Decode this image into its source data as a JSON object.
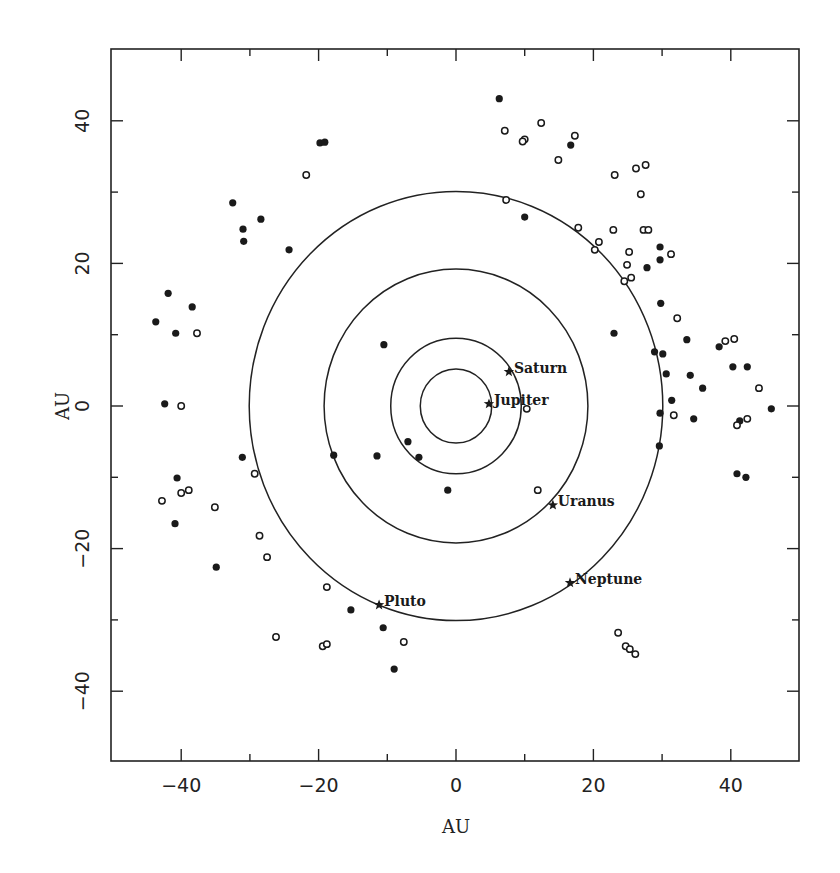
{
  "chart_data": {
    "type": "scatter",
    "title": "",
    "xlabel": "AU",
    "ylabel": "AU",
    "xlim": [
      -50,
      50
    ],
    "ylim": [
      -50,
      50
    ],
    "grid": false,
    "legend": null,
    "x_ticks": [
      -40,
      -20,
      0,
      20,
      40
    ],
    "y_ticks": [
      -40,
      -20,
      0,
      20,
      40
    ],
    "x_minor_ticks": [
      -30,
      -10,
      10,
      30
    ],
    "y_minor_ticks": [
      -30,
      -10,
      10,
      30
    ],
    "x_tick_labels": [
      "−40",
      "−20",
      "0",
      "20",
      "40"
    ],
    "y_tick_labels": [
      "−40",
      "−20",
      "0",
      "20",
      "40"
    ],
    "orbits": [
      {
        "name": "Jupiter orbit",
        "radius_au": 5.2
      },
      {
        "name": "Saturn orbit",
        "radius_au": 9.5
      },
      {
        "name": "Uranus orbit",
        "radius_au": 19.2
      },
      {
        "name": "Neptune orbit",
        "radius_au": 30.1
      }
    ],
    "planets": [
      {
        "name": "Jupiter",
        "x": 4.8,
        "y": 0.3
      },
      {
        "name": "Saturn",
        "x": 7.7,
        "y": 4.8
      },
      {
        "name": "Uranus",
        "x": 14.1,
        "y": -13.9
      },
      {
        "name": "Neptune",
        "x": 16.6,
        "y": -24.8
      },
      {
        "name": "Pluto",
        "x": -11.2,
        "y": -27.9
      }
    ],
    "series": [
      {
        "name": "filled",
        "marker": "filled-circle",
        "points": [
          [
            6.3,
            43.1
          ],
          [
            16.7,
            36.6
          ],
          [
            10.0,
            26.5
          ],
          [
            27.8,
            19.4
          ],
          [
            29.7,
            22.3
          ],
          [
            29.7,
            20.5
          ],
          [
            29.8,
            14.4
          ],
          [
            23.0,
            10.2
          ],
          [
            28.9,
            7.6
          ],
          [
            30.1,
            7.3
          ],
          [
            30.6,
            4.5
          ],
          [
            33.6,
            9.3
          ],
          [
            34.1,
            4.3
          ],
          [
            35.9,
            2.5
          ],
          [
            31.4,
            0.8
          ],
          [
            34.6,
            -1.8
          ],
          [
            29.6,
            -5.6
          ],
          [
            38.3,
            8.3
          ],
          [
            40.3,
            5.5
          ],
          [
            42.4,
            5.5
          ],
          [
            45.9,
            -0.4
          ],
          [
            41.3,
            -2.1
          ],
          [
            40.9,
            -9.5
          ],
          [
            42.2,
            -10.0
          ],
          [
            29.7,
            -1.0
          ],
          [
            -32.5,
            28.5
          ],
          [
            -31.0,
            24.8
          ],
          [
            -30.9,
            23.1
          ],
          [
            -28.4,
            26.2
          ],
          [
            -24.3,
            21.9
          ],
          [
            -19.8,
            36.9
          ],
          [
            -19.1,
            37.0
          ],
          [
            -41.9,
            15.8
          ],
          [
            -38.4,
            13.9
          ],
          [
            -43.7,
            11.8
          ],
          [
            -40.8,
            10.2
          ],
          [
            -42.4,
            0.3
          ],
          [
            -31.1,
            -7.2
          ],
          [
            -40.6,
            -10.1
          ],
          [
            -40.9,
            -16.5
          ],
          [
            -34.9,
            -22.6
          ],
          [
            -17.8,
            -6.9
          ],
          [
            -15.3,
            -28.6
          ],
          [
            -10.6,
            -31.1
          ],
          [
            -9.0,
            -36.9
          ],
          [
            -10.5,
            8.6
          ],
          [
            -7.0,
            -5.0
          ],
          [
            -5.4,
            -7.2
          ],
          [
            -11.5,
            -7.0
          ],
          [
            -1.2,
            -11.8
          ]
        ]
      },
      {
        "name": "open",
        "marker": "open-circle",
        "points": [
          [
            7.1,
            38.6
          ],
          [
            12.4,
            39.7
          ],
          [
            10.0,
            37.4
          ],
          [
            9.7,
            37.1
          ],
          [
            17.3,
            37.9
          ],
          [
            14.9,
            34.5
          ],
          [
            23.1,
            32.4
          ],
          [
            26.2,
            33.3
          ],
          [
            27.6,
            33.8
          ],
          [
            26.9,
            29.7
          ],
          [
            7.3,
            28.9
          ],
          [
            17.8,
            25.0
          ],
          [
            22.9,
            24.7
          ],
          [
            27.3,
            24.7
          ],
          [
            28.0,
            24.7
          ],
          [
            20.8,
            23.0
          ],
          [
            20.2,
            21.9
          ],
          [
            31.3,
            21.3
          ],
          [
            24.9,
            19.8
          ],
          [
            25.5,
            18.0
          ],
          [
            24.5,
            17.5
          ],
          [
            25.2,
            21.6
          ],
          [
            32.2,
            12.3
          ],
          [
            39.2,
            9.1
          ],
          [
            40.5,
            9.4
          ],
          [
            44.1,
            2.5
          ],
          [
            31.7,
            -1.3
          ],
          [
            40.9,
            -2.7
          ],
          [
            42.4,
            -1.8
          ],
          [
            10.3,
            -0.4
          ],
          [
            11.9,
            -11.8
          ],
          [
            -21.8,
            32.4
          ],
          [
            -37.7,
            10.2
          ],
          [
            -40.0,
            0.0
          ],
          [
            -40.0,
            -12.2
          ],
          [
            -38.9,
            -11.8
          ],
          [
            -42.8,
            -13.3
          ],
          [
            -35.1,
            -14.2
          ],
          [
            -29.3,
            -9.5
          ],
          [
            -28.6,
            -18.2
          ],
          [
            -27.5,
            -21.2
          ],
          [
            -18.8,
            -25.4
          ],
          [
            -26.2,
            -32.4
          ],
          [
            -19.4,
            -33.7
          ],
          [
            -18.8,
            -33.4
          ],
          [
            -7.6,
            -33.1
          ],
          [
            23.6,
            -31.8
          ],
          [
            24.7,
            -33.7
          ],
          [
            25.3,
            -34.1
          ],
          [
            26.1,
            -34.8
          ]
        ]
      }
    ]
  },
  "layout": {
    "frame": {
      "left": 111,
      "top": 49,
      "right": 799,
      "bottom": 761
    },
    "origin_px": {
      "x": 456,
      "y": 406
    },
    "px_per_au": {
      "x": 6.87,
      "y": 7.13
    },
    "colors": {
      "ink": "#1a1a1a",
      "background": "#ffffff"
    }
  }
}
